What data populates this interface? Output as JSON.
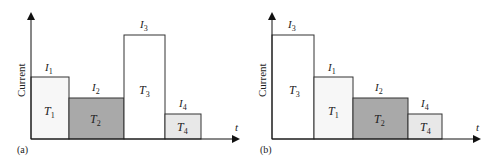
{
  "panels": [
    {
      "id": "a",
      "label": "(a)",
      "y_axis_label": "Current",
      "x_axis_label": "t",
      "bars": [
        {
          "task": "T",
          "task_sub": "1",
          "current": "I",
          "current_sub": "1",
          "fill": "#f7f7f7"
        },
        {
          "task": "T",
          "task_sub": "2",
          "current": "I",
          "current_sub": "2",
          "fill": "#a9a9a9"
        },
        {
          "task": "T",
          "task_sub": "3",
          "current": "I",
          "current_sub": "3",
          "fill": "#ffffff"
        },
        {
          "task": "T",
          "task_sub": "4",
          "current": "I",
          "current_sub": "4",
          "fill": "#e8e8e8"
        }
      ]
    },
    {
      "id": "b",
      "label": "(b)",
      "y_axis_label": "Current",
      "x_axis_label": "t",
      "bars": [
        {
          "task": "T",
          "task_sub": "3",
          "current": "I",
          "current_sub": "3",
          "fill": "#ffffff"
        },
        {
          "task": "T",
          "task_sub": "1",
          "current": "I",
          "current_sub": "1",
          "fill": "#f7f7f7"
        },
        {
          "task": "T",
          "task_sub": "2",
          "current": "I",
          "current_sub": "2",
          "fill": "#a9a9a9"
        },
        {
          "task": "T",
          "task_sub": "4",
          "current": "I",
          "current_sub": "4",
          "fill": "#e8e8e8"
        }
      ]
    }
  ]
}
